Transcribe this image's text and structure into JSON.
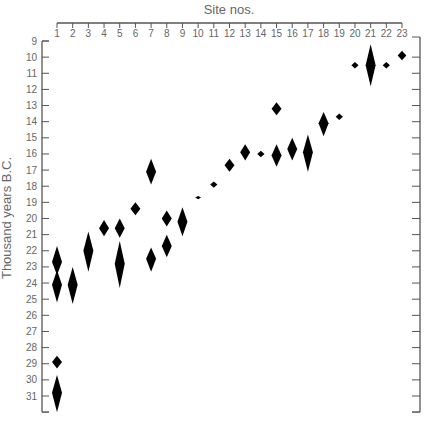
{
  "chart_data": {
    "type": "scatter",
    "title": "",
    "xlabel": "Site nos.",
    "ylabel": "Thousand years B.C.",
    "x_ticks": [
      1,
      2,
      3,
      4,
      5,
      6,
      7,
      8,
      9,
      10,
      11,
      12,
      13,
      14,
      15,
      16,
      17,
      18,
      19,
      20,
      21,
      22,
      23
    ],
    "y_ticks": [
      9,
      10,
      11,
      12,
      13,
      14,
      15,
      16,
      17,
      18,
      19,
      20,
      21,
      22,
      23,
      24,
      25,
      26,
      27,
      28,
      29,
      30,
      31
    ],
    "ylim": [
      9,
      32
    ],
    "y_inverted": true,
    "x_axis_position": "top",
    "marker": "diamond (vertical length = date range)",
    "grid": false,
    "points": [
      {
        "site": 1,
        "y": 22.7,
        "low": 21.7,
        "high": 23.5
      },
      {
        "site": 1,
        "y": 24.1,
        "low": 23.2,
        "high": 25.2
      },
      {
        "site": 1,
        "y": 28.9,
        "low": 28.5,
        "high": 29.3
      },
      {
        "site": 1,
        "y": 30.8,
        "low": 29.7,
        "high": 32.0
      },
      {
        "site": 2,
        "y": 24.1,
        "low": 23.0,
        "high": 25.3
      },
      {
        "site": 3,
        "y": 22.0,
        "low": 20.8,
        "high": 23.3
      },
      {
        "site": 4,
        "y": 20.6,
        "low": 20.1,
        "high": 21.1
      },
      {
        "site": 5,
        "y": 20.6,
        "low": 20.0,
        "high": 21.2
      },
      {
        "site": 5,
        "y": 22.8,
        "low": 21.4,
        "high": 24.3
      },
      {
        "site": 6,
        "y": 19.4,
        "low": 19.0,
        "high": 19.8
      },
      {
        "site": 7,
        "y": 17.1,
        "low": 16.3,
        "high": 17.9
      },
      {
        "site": 7,
        "y": 22.5,
        "low": 21.8,
        "high": 23.3
      },
      {
        "site": 8,
        "y": 20.0,
        "low": 19.5,
        "high": 20.5
      },
      {
        "site": 8,
        "y": 21.7,
        "low": 21.0,
        "high": 22.4
      },
      {
        "site": 9,
        "y": 20.2,
        "low": 19.3,
        "high": 21.1
      },
      {
        "site": 10,
        "y": 18.7,
        "low": 18.6,
        "high": 18.8
      },
      {
        "site": 11,
        "y": 17.9,
        "low": 17.7,
        "high": 18.1
      },
      {
        "site": 12,
        "y": 16.7,
        "low": 16.3,
        "high": 17.1
      },
      {
        "site": 13,
        "y": 15.9,
        "low": 15.4,
        "high": 16.4
      },
      {
        "site": 14,
        "y": 16.0,
        "low": 15.8,
        "high": 16.2
      },
      {
        "site": 15,
        "y": 13.2,
        "low": 12.8,
        "high": 13.6
      },
      {
        "site": 15,
        "y": 16.1,
        "low": 15.4,
        "high": 16.8
      },
      {
        "site": 16,
        "y": 15.7,
        "low": 15.0,
        "high": 16.4
      },
      {
        "site": 17,
        "y": 15.9,
        "low": 14.8,
        "high": 17.1
      },
      {
        "site": 18,
        "y": 14.1,
        "low": 13.4,
        "high": 14.9
      },
      {
        "site": 19,
        "y": 13.7,
        "low": 13.5,
        "high": 13.9
      },
      {
        "site": 20,
        "y": 10.5,
        "low": 10.3,
        "high": 10.7
      },
      {
        "site": 21,
        "y": 10.5,
        "low": 9.2,
        "high": 11.8
      },
      {
        "site": 22,
        "y": 10.5,
        "low": 10.3,
        "high": 10.7
      },
      {
        "site": 23,
        "y": 9.9,
        "low": 9.6,
        "high": 10.2
      }
    ]
  }
}
